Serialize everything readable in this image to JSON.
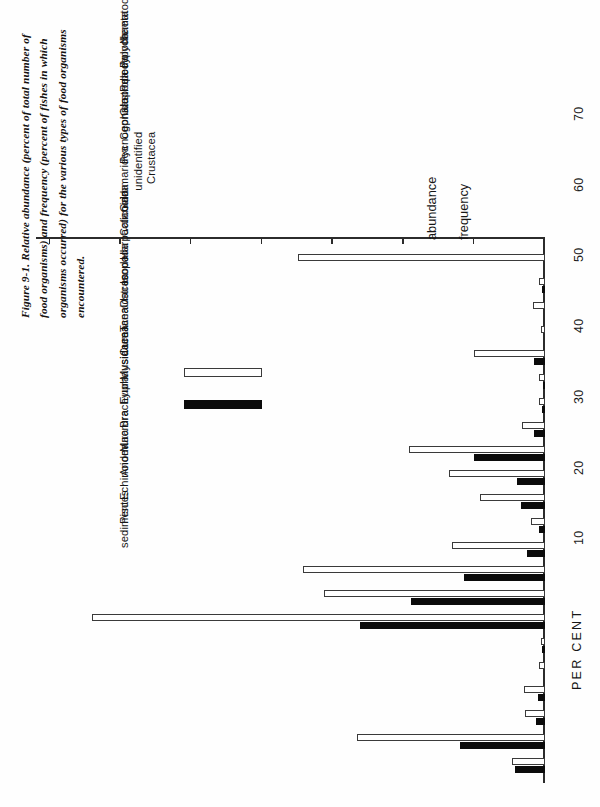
{
  "figure": {
    "caption": "Figure 9-1. Relative abundance (percent of total number of food organisms) and frequency (percent of fishes in which organisms occurred) for the various types of food organisms encountered."
  },
  "legend": {
    "abundance_label": "abundance",
    "frequency_label": "frequency",
    "abundance_color": "#0b0b0b",
    "frequency_color": "#ffffff",
    "frequency_border": "#3a3a3a"
  },
  "axis": {
    "title": "PER CENT",
    "tick_labels": [
      "10",
      "20",
      "30",
      "40",
      "50",
      "60",
      "70"
    ],
    "min": 0,
    "max": 72
  },
  "chart_data": {
    "type": "bar",
    "title": "Figure 9-1. Relative abundance (percent of total number of food organisms) and frequency (percent of fishes in which organisms occurred) for the various types of food organisms encountered.",
    "orientation": "horizontal-printed-sideways",
    "xlabel": "",
    "ylabel": "PER CENT",
    "ylim": [
      0,
      72
    ],
    "grid": false,
    "legend_position": "right-inside",
    "categories": [
      "Nematoda",
      "Polychaeta",
      "Pelecypoda",
      "Gastropoda",
      "Cephalopoda",
      "Pycnogonida",
      "unidentified Crustacea",
      "Gammaridea",
      "Calanoida",
      "Harpacticoida",
      "Isopoda",
      "Ostracoda",
      "Tanaidacea",
      "Cumacea",
      "Mysidacea",
      "Euphausiacea",
      "Brachyura",
      "Macrura",
      "Anomura",
      "Echinoidea",
      "Pisces",
      "sediment"
    ],
    "series": [
      {
        "name": "abundance",
        "values": [
          4.2,
          12.0,
          1.3,
          1.0,
          0.0,
          0.4,
          26.2,
          19.0,
          11.5,
          2.5,
          0.8,
          3.4,
          4.0,
          10.0,
          1.5,
          0.4,
          0.3,
          1.5,
          0.0,
          0.0,
          0.4,
          0.0
        ]
      },
      {
        "name": "frequency",
        "values": [
          4.6,
          26.6,
          2.8,
          3.0,
          0.9,
          0.6,
          64.0,
          31.2,
          34.2,
          13.1,
          2.0,
          9.2,
          13.6,
          19.3,
          3.3,
          0.9,
          0.9,
          10.0,
          0.5,
          1.7,
          0.9,
          35.0
        ]
      }
    ]
  },
  "category_display": [
    {
      "lines": [
        "Nematoda"
      ]
    },
    {
      "lines": [
        "Polychaeta"
      ]
    },
    {
      "lines": [
        "Pelecypoda"
      ]
    },
    {
      "lines": [
        "Gastropoda"
      ]
    },
    {
      "lines": [
        "Cephalopoda"
      ]
    },
    {
      "lines": [
        "Pycnogonida"
      ]
    },
    {
      "lines": [
        "unidentified",
        "Crustacea"
      ]
    },
    {
      "lines": [
        "Gammaridea"
      ]
    },
    {
      "lines": [
        "Calanoida"
      ]
    },
    {
      "lines": [
        "Harpacticoida"
      ]
    },
    {
      "lines": [
        "Isopoda"
      ]
    },
    {
      "lines": [
        "Ostracoda"
      ]
    },
    {
      "lines": [
        "Tanaidacea"
      ]
    },
    {
      "lines": [
        "Cumacea"
      ]
    },
    {
      "lines": [
        "Mysidacea"
      ]
    },
    {
      "lines": [
        "Euphausiacea"
      ]
    },
    {
      "lines": [
        "Brachyura"
      ]
    },
    {
      "lines": [
        "Macrura"
      ]
    },
    {
      "lines": [
        "Anomura"
      ]
    },
    {
      "lines": [
        "Echinoidea"
      ]
    },
    {
      "lines": [
        "Pisces"
      ]
    },
    {
      "lines": [
        "sediment"
      ]
    }
  ]
}
